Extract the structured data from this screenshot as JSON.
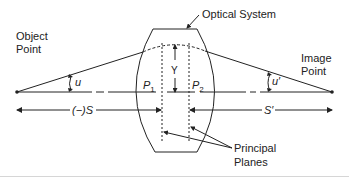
{
  "diagram": {
    "labels": {
      "optical_system": "Optical System",
      "object_point_line1": "Object",
      "object_point_line2": "Point",
      "image_point_line1": "Image",
      "image_point_line2": "Point",
      "u": "u",
      "u_prime": "u′",
      "y": "Y",
      "p1_main": "P",
      "p1_sub": "1",
      "p2_main": "P",
      "p2_sub": "2",
      "s_object": "(−)S",
      "s_image": "S′",
      "principal_planes_line1": "Principal",
      "principal_planes_line2": "Planes"
    },
    "colors": {
      "line": "#222222",
      "text": "#222222",
      "separator": "#d6d6d6"
    }
  }
}
